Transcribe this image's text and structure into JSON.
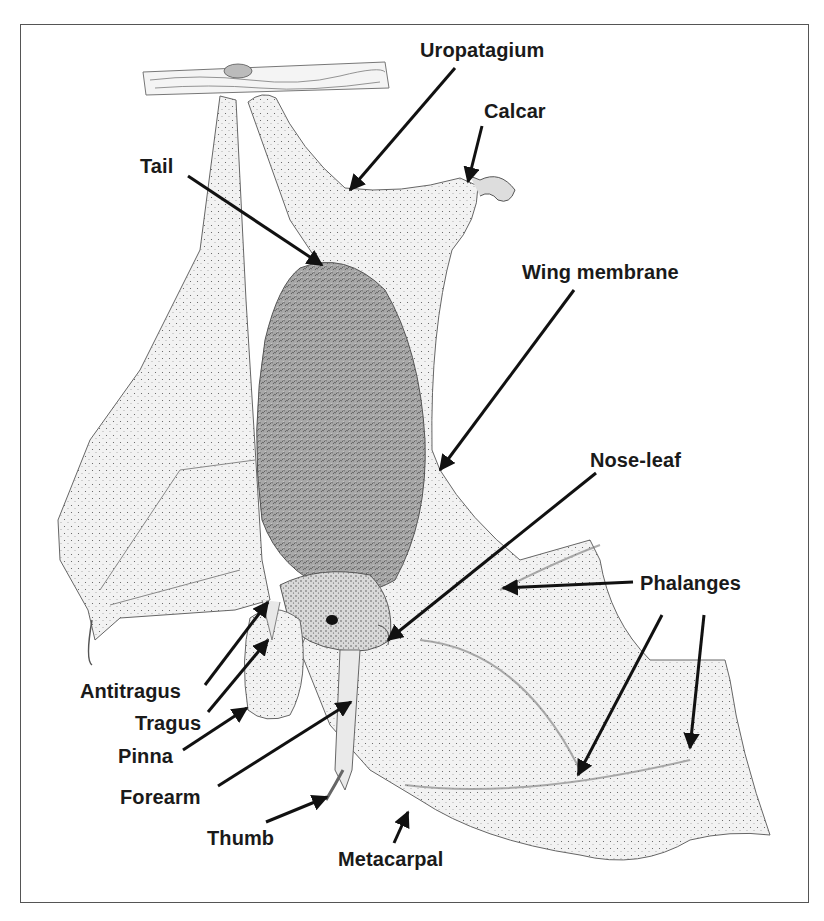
{
  "figure": {
    "colors": {
      "frame": "#555555",
      "ink": "#1a1a1a",
      "stipple_dark": "#3a3a3a",
      "membrane_fill": "#efefef",
      "fur_fill": "#9a9a9a",
      "background": "#ffffff"
    }
  },
  "labels": [
    {
      "id": "uropatagium",
      "text": "Uropatagium",
      "x": 420,
      "y": 40,
      "arrows": [
        {
          "from": [
            455,
            68
          ],
          "to": [
            350,
            190
          ]
        }
      ]
    },
    {
      "id": "calcar",
      "text": "Calcar",
      "x": 484,
      "y": 101,
      "arrows": [
        {
          "from": [
            482,
            126
          ],
          "to": [
            468,
            182
          ]
        }
      ]
    },
    {
      "id": "tail",
      "text": "Tail",
      "x": 140,
      "y": 156,
      "arrows": [
        {
          "from": [
            188,
            176
          ],
          "to": [
            322,
            265
          ]
        }
      ]
    },
    {
      "id": "wing-membrane",
      "text": "Wing membrane",
      "x": 522,
      "y": 262,
      "arrows": [
        {
          "from": [
            574,
            290
          ],
          "to": [
            440,
            470
          ]
        }
      ]
    },
    {
      "id": "nose-leaf",
      "text": "Nose-leaf",
      "x": 590,
      "y": 450,
      "arrows": [
        {
          "from": [
            596,
            473
          ],
          "to": [
            388,
            640
          ]
        }
      ]
    },
    {
      "id": "phalanges",
      "text": "Phalanges",
      "x": 640,
      "y": 573,
      "arrows": [
        {
          "from": [
            633,
            582
          ],
          "to": [
            503,
            588
          ]
        },
        {
          "from": [
            662,
            615
          ],
          "to": [
            578,
            775
          ]
        },
        {
          "from": [
            704,
            615
          ],
          "to": [
            690,
            748
          ]
        }
      ]
    },
    {
      "id": "antitragus",
      "text": "Antitragus",
      "x": 80,
      "y": 681,
      "arrows": [
        {
          "from": [
            205,
            685
          ],
          "to": [
            268,
            602
          ]
        }
      ]
    },
    {
      "id": "tragus",
      "text": "Tragus",
      "x": 135,
      "y": 713,
      "arrows": [
        {
          "from": [
            208,
            712
          ],
          "to": [
            268,
            640
          ]
        }
      ]
    },
    {
      "id": "pinna",
      "text": "Pinna",
      "x": 118,
      "y": 746,
      "arrows": [
        {
          "from": [
            183,
            750
          ],
          "to": [
            247,
            708
          ]
        }
      ]
    },
    {
      "id": "forearm",
      "text": "Forearm",
      "x": 120,
      "y": 787,
      "arrows": [
        {
          "from": [
            218,
            786
          ],
          "to": [
            351,
            702
          ]
        }
      ]
    },
    {
      "id": "thumb",
      "text": "Thumb",
      "x": 207,
      "y": 828,
      "arrows": [
        {
          "from": [
            266,
            822
          ],
          "to": [
            327,
            797
          ]
        }
      ]
    },
    {
      "id": "metacarpal",
      "text": "Metacarpal",
      "x": 338,
      "y": 849,
      "arrows": [
        {
          "from": [
            394,
            843
          ],
          "to": [
            408,
            812
          ]
        }
      ]
    }
  ]
}
